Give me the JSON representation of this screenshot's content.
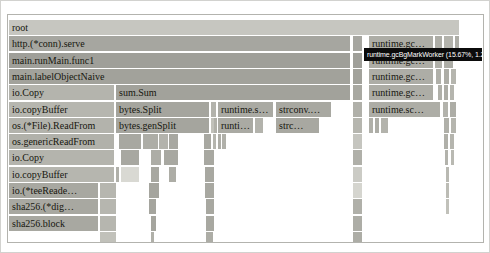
{
  "tooltip": {
    "text": "runtime.gcBgMarkWorker (15.67%, 1.21s)",
    "x": 356,
    "y": 33,
    "w": 118,
    "h": 13
  },
  "flame": {
    "bar_height": 15,
    "rows": [
      {
        "y": 5,
        "bars": [
          {
            "x": 1,
            "w": 450,
            "c": "#c6c6c0",
            "t": "root"
          }
        ]
      },
      {
        "y": 21,
        "bars": [
          {
            "x": 1,
            "w": 341,
            "c": "#a6a6a0",
            "t": "http.(*conn).serve"
          },
          {
            "x": 345,
            "w": 9,
            "c": "#a6a6a0"
          },
          {
            "x": 361,
            "w": 64,
            "c": "#adada6",
            "t": "runtime.gc…"
          },
          {
            "x": 427,
            "w": 7,
            "c": "#adada6"
          },
          {
            "x": 436,
            "w": 9,
            "c": "#b3b3ac"
          },
          {
            "x": 447,
            "w": 4,
            "c": "#adada6"
          }
        ]
      },
      {
        "y": 38,
        "bars": [
          {
            "x": 1,
            "w": 341,
            "c": "#9f9f99",
            "t": "main.runMain.func1"
          },
          {
            "x": 345,
            "w": 9,
            "c": "#9f9f99"
          },
          {
            "x": 361,
            "w": 64,
            "c": "#adada6",
            "t": "runtime.gc…"
          },
          {
            "x": 427,
            "w": 7,
            "c": "#b0b0a9"
          },
          {
            "x": 436,
            "w": 9,
            "c": "#adada6"
          }
        ]
      },
      {
        "y": 54,
        "bars": [
          {
            "x": 1,
            "w": 341,
            "c": "#a2a29b",
            "t": "main.labelObjectNaive"
          },
          {
            "x": 345,
            "w": 9,
            "c": "#a2a29b"
          },
          {
            "x": 361,
            "w": 64,
            "c": "#adada6",
            "t": "runtime.gc…"
          },
          {
            "x": 428,
            "w": 5,
            "c": "#b0b0a9"
          },
          {
            "x": 436,
            "w": 5,
            "c": "#adada6"
          },
          {
            "x": 443,
            "w": 5,
            "c": "#b5b5ae"
          }
        ]
      },
      {
        "y": 70,
        "bars": [
          {
            "x": 1,
            "w": 105,
            "c": "#b4b4ad",
            "t": "io.Copy"
          },
          {
            "x": 108,
            "w": 234,
            "c": "#a2a29b",
            "t": "sum.Sum"
          },
          {
            "x": 345,
            "w": 9,
            "c": "#a8a8a1"
          },
          {
            "x": 361,
            "w": 64,
            "c": "#adada6",
            "t": "runtime.gc…"
          },
          {
            "x": 430,
            "w": 4,
            "c": "#b0b0a9"
          },
          {
            "x": 436,
            "w": 4,
            "c": "#adada6"
          },
          {
            "x": 442,
            "w": 4,
            "c": "#b5b5ae"
          }
        ]
      },
      {
        "y": 87,
        "bars": [
          {
            "x": 1,
            "w": 105,
            "c": "#b6b6af",
            "t": "io.copyBuffer"
          },
          {
            "x": 108,
            "w": 93,
            "c": "#a5a59e",
            "t": "bytes.Split"
          },
          {
            "x": 203,
            "w": 5,
            "c": "#b3b3ac"
          },
          {
            "x": 210,
            "w": 55,
            "c": "#aaaaa3",
            "t": "runtime.s…"
          },
          {
            "x": 268,
            "w": 55,
            "c": "#a8a8a1",
            "t": "strconv.…"
          },
          {
            "x": 345,
            "w": 9,
            "c": "#b0b0a9"
          },
          {
            "x": 361,
            "w": 71,
            "c": "#adada6",
            "t": "runtime.sc…"
          },
          {
            "x": 435,
            "w": 5,
            "c": "#b3b3ac"
          },
          {
            "x": 442,
            "w": 6,
            "c": "#adada6"
          }
        ]
      },
      {
        "y": 103,
        "bars": [
          {
            "x": 1,
            "w": 105,
            "c": "#b3b3ac",
            "t": "os.(*File).ReadFrom"
          },
          {
            "x": 108,
            "w": 93,
            "c": "#a5a59e",
            "t": "bytes.genSplit"
          },
          {
            "x": 203,
            "w": 2,
            "c": "#c1c1ba"
          },
          {
            "x": 206,
            "w": 2,
            "c": "#b0b0a9"
          },
          {
            "x": 210,
            "w": 35,
            "c": "#aaaaa3",
            "t": "runti…"
          },
          {
            "x": 247,
            "w": 8,
            "c": "#b3b3ac"
          },
          {
            "x": 268,
            "w": 43,
            "c": "#a8a8a1",
            "t": "strc…"
          },
          {
            "x": 345,
            "w": 9,
            "c": "#b6b6af"
          },
          {
            "x": 361,
            "w": 4,
            "c": "#b0b0a9"
          },
          {
            "x": 367,
            "w": 4,
            "c": "#adada6"
          },
          {
            "x": 373,
            "w": 7,
            "c": "#b3b3ac"
          },
          {
            "x": 436,
            "w": 5,
            "c": "#b0b0a9"
          },
          {
            "x": 443,
            "w": 5,
            "c": "#b5b5ae"
          }
        ]
      },
      {
        "y": 119,
        "bars": [
          {
            "x": 1,
            "w": 105,
            "c": "#b1b1aa",
            "t": "os.genericReadFrom"
          },
          {
            "x": 111,
            "w": 22,
            "c": "#a8a8a1"
          },
          {
            "x": 135,
            "w": 15,
            "c": "#adada6"
          },
          {
            "x": 151,
            "w": 9,
            "c": "#b3b3ac"
          },
          {
            "x": 161,
            "w": 9,
            "c": "#a8a8a1"
          },
          {
            "x": 196,
            "w": 7,
            "c": "#a8a8a1"
          },
          {
            "x": 205,
            "w": 3,
            "c": "#b5b5ae"
          },
          {
            "x": 210,
            "w": 3,
            "c": "#adada6"
          },
          {
            "x": 214,
            "w": 4,
            "c": "#b0b0a9"
          },
          {
            "x": 345,
            "w": 9,
            "c": "#c5c5bf"
          },
          {
            "x": 436,
            "w": 4,
            "c": "#b0b0a9"
          },
          {
            "x": 442,
            "w": 4,
            "c": "#b5b5ae"
          }
        ]
      },
      {
        "y": 135,
        "bars": [
          {
            "x": 1,
            "w": 105,
            "c": "#b4b4ad",
            "t": "io.Copy"
          },
          {
            "x": 113,
            "w": 18,
            "c": "#a8a8a1"
          },
          {
            "x": 143,
            "w": 10,
            "c": "#adada6"
          },
          {
            "x": 156,
            "w": 14,
            "c": "#a8a8a1"
          },
          {
            "x": 196,
            "w": 10,
            "c": "#a8a8a1"
          },
          {
            "x": 345,
            "w": 9,
            "c": "#b0b0a9"
          },
          {
            "x": 437,
            "w": 3,
            "c": "#b3b3ac"
          },
          {
            "x": 443,
            "w": 2,
            "c": "#b9b9b2"
          }
        ]
      },
      {
        "y": 152,
        "bars": [
          {
            "x": 1,
            "w": 105,
            "c": "#b6b6af",
            "t": "io.copyBuffer"
          },
          {
            "x": 108,
            "w": 3,
            "c": "#b0b0a9"
          },
          {
            "x": 113,
            "w": 18,
            "c": "#d9d9d3"
          },
          {
            "x": 143,
            "w": 8,
            "c": "#a8a8a1"
          },
          {
            "x": 161,
            "w": 7,
            "c": "#adada6"
          },
          {
            "x": 197,
            "w": 9,
            "c": "#a8a8a1"
          },
          {
            "x": 345,
            "w": 9,
            "c": "#cbcbc5"
          },
          {
            "x": 438,
            "w": 2,
            "c": "#b9b9b2"
          }
        ]
      },
      {
        "y": 168,
        "bars": [
          {
            "x": 1,
            "w": 89,
            "c": "#a8a8a1",
            "t": "io.(*teeReade…"
          },
          {
            "x": 92,
            "w": 16,
            "c": "#b6b6af"
          },
          {
            "x": 141,
            "w": 10,
            "c": "#a5a59e"
          },
          {
            "x": 197,
            "w": 9,
            "c": "#a8a8a1"
          },
          {
            "x": 345,
            "w": 9,
            "c": "#d5d5cf"
          },
          {
            "x": 438,
            "w": 2,
            "c": "#bcbcb5"
          }
        ]
      },
      {
        "y": 184,
        "bars": [
          {
            "x": 1,
            "w": 89,
            "c": "#a8a8a1",
            "t": "sha256.(*dig…"
          },
          {
            "x": 92,
            "w": 16,
            "c": "#b6b6af"
          },
          {
            "x": 141,
            "w": 7,
            "c": "#a5a59e"
          },
          {
            "x": 198,
            "w": 8,
            "c": "#a8a8a1"
          },
          {
            "x": 345,
            "w": 9,
            "c": "#b0b0a9"
          },
          {
            "x": 438,
            "w": 2,
            "c": "#c1c1ba"
          }
        ]
      },
      {
        "y": 201,
        "bars": [
          {
            "x": 1,
            "w": 89,
            "c": "#a8a8a1",
            "t": "sha256.block"
          },
          {
            "x": 92,
            "w": 16,
            "c": "#b6b6af"
          },
          {
            "x": 143,
            "w": 5,
            "c": "#a5a59e"
          },
          {
            "x": 198,
            "w": 8,
            "c": "#a8a8a1"
          },
          {
            "x": 345,
            "w": 9,
            "c": "#adada6"
          }
        ]
      },
      {
        "y": 217,
        "bars": [
          {
            "x": 92,
            "w": 16,
            "c": "#c1c1ba"
          },
          {
            "x": 143,
            "w": 3,
            "c": "#b0b0a9"
          },
          {
            "x": 198,
            "w": 7,
            "c": "#adada6"
          },
          {
            "x": 345,
            "w": 9,
            "c": "#adada6"
          }
        ]
      }
    ]
  },
  "chart_data": {
    "type": "flamegraph",
    "title": "",
    "unit": "seconds",
    "hovered_frame": {
      "name": "runtime.gcBgMarkWorker",
      "percent": 15.67,
      "value": "1.21s"
    },
    "visible_frames": [
      {
        "depth": 0,
        "labels": [
          "root"
        ]
      },
      {
        "depth": 1,
        "labels": [
          "http.(*conn).serve",
          "runtime.gc…"
        ]
      },
      {
        "depth": 2,
        "labels": [
          "main.runMain.func1",
          "runtime.gc…"
        ]
      },
      {
        "depth": 3,
        "labels": [
          "main.labelObjectNaive",
          "runtime.gc…"
        ]
      },
      {
        "depth": 4,
        "labels": [
          "io.Copy",
          "sum.Sum",
          "runtime.gc…"
        ]
      },
      {
        "depth": 5,
        "labels": [
          "io.copyBuffer",
          "bytes.Split",
          "runtime.s…",
          "strconv.…",
          "runtime.sc…"
        ]
      },
      {
        "depth": 6,
        "labels": [
          "os.(*File).ReadFrom",
          "bytes.genSplit",
          "runti…",
          "strc…"
        ]
      },
      {
        "depth": 7,
        "labels": [
          "os.genericReadFrom"
        ]
      },
      {
        "depth": 8,
        "labels": [
          "io.Copy"
        ]
      },
      {
        "depth": 9,
        "labels": [
          "io.copyBuffer"
        ]
      },
      {
        "depth": 10,
        "labels": [
          "io.(*teeReade…"
        ]
      },
      {
        "depth": 11,
        "labels": [
          "sha256.(*dig…"
        ]
      },
      {
        "depth": 12,
        "labels": [
          "sha256.block"
        ]
      }
    ]
  }
}
